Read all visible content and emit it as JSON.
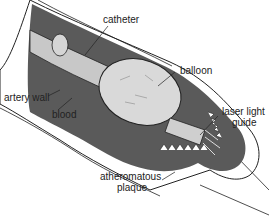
{
  "diagram": {
    "labels": {
      "catheter": "catheter",
      "balloon": "balloon",
      "artery_wall": "artery wall",
      "blood": "blood",
      "laser_light_guide_line1": "laser light",
      "laser_light_guide_line2": "guide",
      "plaque_line1": "atheromatous",
      "plaque_line2": "plaque"
    },
    "colors": {
      "blood": "#5a5a5a",
      "balloon": "#d9d9d9",
      "catheter": "#c8c8c8",
      "wall": "#ffffff",
      "outline": "#222222"
    }
  }
}
